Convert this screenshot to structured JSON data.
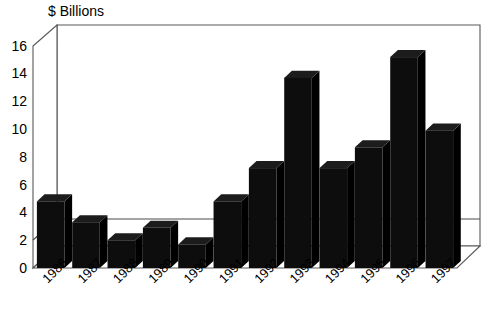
{
  "chart_data": {
    "type": "bar",
    "title": "$ Billions",
    "xlabel": "",
    "ylabel": "$ Billions",
    "ylim": [
      0,
      16
    ],
    "yticks": [
      0,
      2,
      4,
      6,
      8,
      10,
      12,
      14,
      16
    ],
    "grid": true,
    "legend": "none",
    "style": "3d-perspective-column",
    "bar_color": "#0d0d0d",
    "axis_color": "#58585a",
    "categories": [
      "1986",
      "1987",
      "1988",
      "1989",
      "1990",
      "1991",
      "1992",
      "1993",
      "1994",
      "1995",
      "1996",
      "1997"
    ],
    "values": [
      4.8,
      3.3,
      2.0,
      2.9,
      1.7,
      4.8,
      7.2,
      13.7,
      7.2,
      8.7,
      15.2,
      9.9
    ]
  },
  "axis": {
    "y_title": "$ Billions",
    "y_tick_labels": [
      "16",
      "14",
      "12",
      "10",
      "8",
      "6",
      "4",
      "2",
      "0"
    ],
    "x_tick_labels": [
      "1986",
      "1987",
      "1988",
      "1989",
      "1990",
      "1991",
      "1992",
      "1993",
      "1994",
      "1995",
      "1996",
      "1997"
    ]
  }
}
